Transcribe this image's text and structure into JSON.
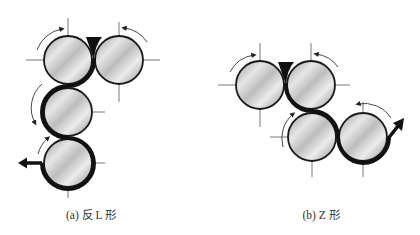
{
  "figure": {
    "panels": [
      {
        "id": "a",
        "caption": "(a) 反 L 形",
        "caption_x": 91,
        "rolls": [
          {
            "cx": 68,
            "cy": 60,
            "rotation": "cw"
          },
          {
            "cx": 119,
            "cy": 60,
            "rotation": "ccw"
          },
          {
            "cx": 68,
            "cy": 112,
            "rotation": "ccw"
          },
          {
            "cx": 68,
            "cy": 163,
            "rotation": "cw"
          }
        ]
      },
      {
        "id": "b",
        "caption": "(b) Z 形",
        "caption_x": 321,
        "rolls": [
          {
            "cx": 260,
            "cy": 85,
            "rotation": "cw"
          },
          {
            "cx": 311,
            "cy": 85,
            "rotation": "ccw"
          },
          {
            "cx": 312,
            "cy": 137,
            "rotation": "cw"
          },
          {
            "cx": 363,
            "cy": 137,
            "rotation": "ccw"
          }
        ]
      }
    ],
    "roll_radius": 24,
    "colors": {
      "web": "#111111",
      "roll_outline": "#1a1a1a",
      "axis_line": "#555555",
      "roll_light": "#f2f2f2",
      "roll_dark": "#8c8c8c"
    }
  }
}
